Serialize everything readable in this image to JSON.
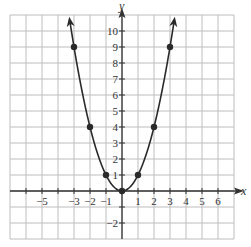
{
  "chart_data": {
    "type": "line",
    "title": "",
    "function": "y = x^2",
    "xlabel": "x",
    "ylabel": "y",
    "xlim": [
      -7,
      7
    ],
    "ylim": [
      -3,
      11
    ],
    "grid": true,
    "x_tick_labels": [
      "-5",
      "-3",
      "-2",
      "-1",
      "1",
      "2",
      "3",
      "4",
      "5",
      "6"
    ],
    "y_tick_labels": [
      "10",
      "9",
      "8",
      "7",
      "6",
      "5",
      "4",
      "3",
      "2",
      "1",
      "-2"
    ],
    "points": [
      {
        "x": -3,
        "y": 9
      },
      {
        "x": -2,
        "y": 4
      },
      {
        "x": -1,
        "y": 1
      },
      {
        "x": 0,
        "y": 0
      },
      {
        "x": 1,
        "y": 1
      },
      {
        "x": 2,
        "y": 4
      },
      {
        "x": 3,
        "y": 9
      }
    ],
    "curve_arrows": "both ends upward",
    "colors": {
      "grid": "#bdbdbd",
      "axis": "#333333",
      "curve": "#2a2a2a"
    }
  }
}
